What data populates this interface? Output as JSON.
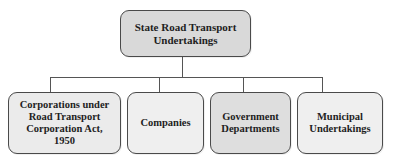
{
  "diagram": {
    "type": "org-chart",
    "root": {
      "label": "State Road Transport\nUndertakings",
      "fill": "#d9d9d9"
    },
    "children": [
      {
        "label": "Corporations under\nRoad Transport\nCorporation Act,\n1950",
        "fill": "#ebebeb"
      },
      {
        "label": "Companies",
        "fill": "#efefef"
      },
      {
        "label": "Government\nDepartments",
        "fill": "#dedede"
      },
      {
        "label": "Municipal\nUndertakings",
        "fill": "#efefef"
      }
    ],
    "colors": {
      "border": "#4a4a4a",
      "connector": "#555555",
      "text": "#1e1e1e",
      "background": "#ffffff"
    }
  }
}
